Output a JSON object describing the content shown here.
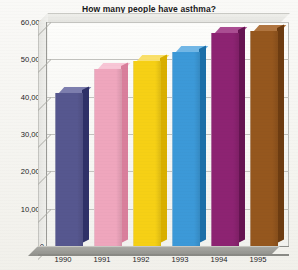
{
  "chart_data": {
    "type": "bar",
    "title": "How many people have asthma?",
    "xlabel": "",
    "ylabel": "",
    "categories": [
      "1990",
      "1991",
      "1992",
      "1993",
      "1994",
      "1995"
    ],
    "values": [
      41000,
      47500,
      49500,
      52000,
      57000,
      57500
    ],
    "ylim": [
      0,
      60000
    ],
    "ytick_labels": [
      "60,000",
      "50,000",
      "40,000",
      "30,000",
      "20,000",
      "10,000",
      "0"
    ],
    "ytick_values": [
      60000,
      50000,
      40000,
      30000,
      20000,
      10000,
      0
    ],
    "grid": true,
    "legend": "none",
    "style": "3d-column",
    "series": [
      {
        "name": "People with asthma",
        "values": [
          41000,
          47500,
          49500,
          52000,
          57000,
          57500
        ],
        "colors": [
          "#56578f",
          "#efa6bd",
          "#f6d015",
          "#3c99d8",
          "#8d2372",
          "#95571e"
        ],
        "side_colors": [
          "#2f3168",
          "#d97f9c",
          "#d9af00",
          "#1c6fa8",
          "#651451",
          "#6d3c11"
        ],
        "top_colors": [
          "#7d7eae",
          "#f8c6d6",
          "#fae06a",
          "#72b7e6",
          "#aa4d92",
          "#b07540"
        ]
      }
    ]
  },
  "axis": {
    "y_labels": [
      "60,000",
      "50,000",
      "40,000",
      "30,000",
      "20,000",
      "10,000"
    ],
    "zero_label": "0",
    "x_labels": [
      "1990",
      "1991",
      "1992",
      "1993",
      "1994",
      "1995"
    ]
  },
  "colors": {
    "background": "#f3f2ed",
    "plot_background": "#fdfdfb",
    "gridline": "#c3c3bf",
    "axis": "#8d8d89",
    "floor": "#9a9a95",
    "text": "#1c1c1e"
  }
}
